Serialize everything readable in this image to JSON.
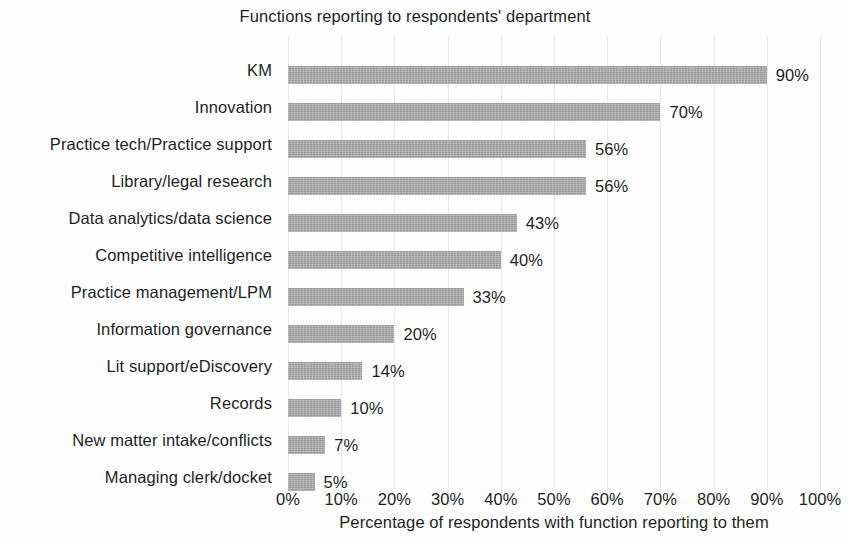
{
  "chart_data": {
    "type": "bar",
    "orientation": "horizontal",
    "title": "Functions reporting to respondents' department",
    "xlabel": "Percentage of respondents with function reporting to them",
    "ylabel": "",
    "xlim": [
      0,
      100
    ],
    "grid": true,
    "legend": false,
    "bar_color": "#a9a9a9",
    "value_suffix": "%",
    "categories": [
      "KM",
      "Innovation",
      "Practice tech/Practice support",
      "Library/legal research",
      "Data analytics/data science",
      "Competitive intelligence",
      "Practice management/LPM",
      "Information governance",
      "Lit support/eDiscovery",
      "Records",
      "New matter intake/conflicts",
      "Managing clerk/docket"
    ],
    "values": [
      90,
      70,
      56,
      56,
      43,
      40,
      33,
      20,
      14,
      10,
      7,
      5
    ],
    "value_labels": [
      "90%",
      "70%",
      "56%",
      "56%",
      "43%",
      "40%",
      "33%",
      "20%",
      "14%",
      "10%",
      "7%",
      "5%"
    ],
    "xticks": [
      0,
      10,
      20,
      30,
      40,
      50,
      60,
      70,
      80,
      90,
      100
    ],
    "xtick_labels": [
      "0%",
      "10%",
      "20%",
      "30%",
      "40%",
      "50%",
      "60%",
      "70%",
      "80%",
      "90%",
      "100%"
    ]
  }
}
